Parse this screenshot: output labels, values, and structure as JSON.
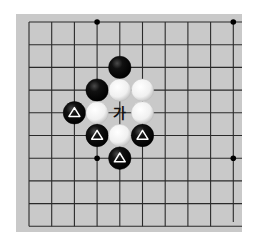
{
  "board": {
    "background": "#c9c9c9",
    "line_color": "#2a2a2a",
    "cols": 10,
    "rows": 10,
    "origin": {
      "x": 29,
      "y": 22
    },
    "spacing": 22.7,
    "edges": {
      "left": 16,
      "top": 14,
      "right": 242,
      "bottom": 232
    },
    "star_points": [
      {
        "col": 3,
        "row": 0
      },
      {
        "col": 9,
        "row": 0
      },
      {
        "col": 3,
        "row": 6
      },
      {
        "col": 9,
        "row": 6
      }
    ]
  },
  "stones": [
    {
      "color": "black",
      "col": 4,
      "row": 2,
      "marker": ""
    },
    {
      "color": "black",
      "col": 3,
      "row": 3,
      "marker": ""
    },
    {
      "color": "white",
      "col": 4,
      "row": 3,
      "marker": ""
    },
    {
      "color": "white",
      "col": 5,
      "row": 3,
      "marker": ""
    },
    {
      "color": "black",
      "col": 2,
      "row": 4,
      "marker": "triangle"
    },
    {
      "color": "white",
      "col": 3,
      "row": 4,
      "marker": ""
    },
    {
      "color": "white",
      "col": 5,
      "row": 4,
      "marker": ""
    },
    {
      "color": "black",
      "col": 3,
      "row": 5,
      "marker": "triangle"
    },
    {
      "color": "white",
      "col": 4,
      "row": 5,
      "marker": ""
    },
    {
      "color": "black",
      "col": 5,
      "row": 5,
      "marker": "triangle"
    },
    {
      "color": "black",
      "col": 4,
      "row": 6,
      "marker": "triangle"
    }
  ],
  "labels": [
    {
      "text": "가",
      "col": 4,
      "row": 4
    }
  ],
  "colors": {
    "black_stone": "#0d0d0d",
    "white_stone": "#f4f4f4",
    "marker": "#ffffff",
    "label": "#111111"
  }
}
